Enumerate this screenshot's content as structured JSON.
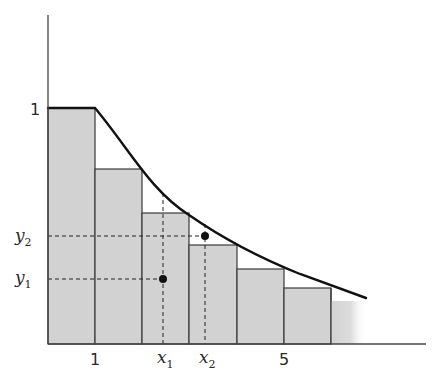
{
  "diagram": {
    "type": "step-function-vs-decreasing-curve",
    "colors": {
      "bar_fill": "#d2d2d2",
      "bar_edge": "#3a3a3a",
      "curve": "#111111",
      "axis": "#444444",
      "guide": "#222222"
    },
    "y_axis_label_1": "1",
    "x_tick_1": "1",
    "x_tick_5": "5",
    "points": {
      "x1": {
        "label": "x",
        "sub": "1"
      },
      "x2": {
        "label": "x",
        "sub": "2"
      },
      "y1": {
        "label": "y",
        "sub": "1"
      },
      "y2": {
        "label": "y",
        "sub": "2"
      }
    },
    "bars": [
      {
        "left": 48,
        "right": 95,
        "top": 108
      },
      {
        "left": 95,
        "right": 142,
        "top": 169
      },
      {
        "left": 142,
        "right": 189,
        "top": 213
      },
      {
        "left": 189,
        "right": 237,
        "top": 245
      },
      {
        "left": 237,
        "right": 284,
        "top": 269
      },
      {
        "left": 284,
        "right": 331,
        "top": 288
      },
      {
        "left": 331,
        "right": 366,
        "top": 301,
        "faded": true
      }
    ]
  }
}
